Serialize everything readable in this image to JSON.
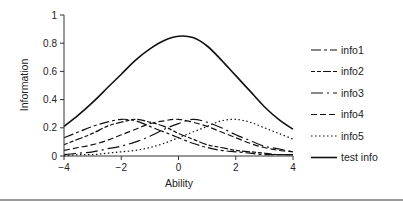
{
  "chart_data": {
    "type": "line",
    "title": "",
    "xlabel": "Ability",
    "ylabel": "Information",
    "xlim": [
      -4,
      4
    ],
    "ylim": [
      0,
      1
    ],
    "xticks": [
      -4,
      -2,
      0,
      2,
      4
    ],
    "yticks": [
      0,
      0.2,
      0.4,
      0.6,
      0.8,
      1
    ],
    "xtick_labels": [
      "-4",
      "-2",
      "0",
      "2",
      "4"
    ],
    "ytick_labels": [
      "0",
      "0.2",
      "0.4",
      "0.6",
      "0.8",
      "1"
    ],
    "grid": false,
    "legend_position": "right",
    "x": [
      -4,
      -3.5,
      -3,
      -2.5,
      -2,
      -1.5,
      -1,
      -0.5,
      0,
      0.5,
      1,
      1.5,
      2,
      2.5,
      3,
      3.5,
      4
    ],
    "series": [
      {
        "name": "info1",
        "dash": "10,3,3,3",
        "values": [
          0.13,
          0.17,
          0.21,
          0.24,
          0.26,
          0.25,
          0.21,
          0.17,
          0.13,
          0.09,
          0.06,
          0.04,
          0.03,
          0.02,
          0.01,
          0.01,
          0.01
        ]
      },
      {
        "name": "info2",
        "dash": "4,2,4,2,8,2",
        "values": [
          0.08,
          0.12,
          0.16,
          0.21,
          0.24,
          0.26,
          0.24,
          0.21,
          0.16,
          0.12,
          0.08,
          0.06,
          0.04,
          0.03,
          0.02,
          0.01,
          0.01
        ]
      },
      {
        "name": "info3",
        "dash": "12,4,2,4",
        "values": [
          0.01,
          0.02,
          0.03,
          0.05,
          0.07,
          0.1,
          0.14,
          0.19,
          0.23,
          0.26,
          0.24,
          0.2,
          0.15,
          0.11,
          0.07,
          0.05,
          0.03
        ]
      },
      {
        "name": "info4",
        "dash": "6,3",
        "values": [
          0.04,
          0.06,
          0.08,
          0.11,
          0.15,
          0.19,
          0.23,
          0.25,
          0.26,
          0.24,
          0.21,
          0.17,
          0.13,
          0.09,
          0.06,
          0.04,
          0.03
        ]
      },
      {
        "name": "info5",
        "dash": "1.5,2.5",
        "values": [
          0.0,
          0.01,
          0.01,
          0.02,
          0.03,
          0.04,
          0.06,
          0.09,
          0.13,
          0.17,
          0.21,
          0.25,
          0.26,
          0.24,
          0.2,
          0.16,
          0.12
        ]
      },
      {
        "name": "test info",
        "dash": "",
        "values": [
          0.21,
          0.29,
          0.38,
          0.48,
          0.58,
          0.68,
          0.76,
          0.82,
          0.85,
          0.84,
          0.78,
          0.68,
          0.57,
          0.46,
          0.35,
          0.26,
          0.19
        ]
      }
    ]
  },
  "legend": {
    "items": [
      {
        "label": "info1"
      },
      {
        "label": "info2"
      },
      {
        "label": "info3"
      },
      {
        "label": "info4"
      },
      {
        "label": "info5"
      },
      {
        "label": "test info"
      }
    ]
  },
  "colors": {
    "line": "#111111",
    "axis": "#333333",
    "bottom_rule": "#9a9a9a"
  }
}
